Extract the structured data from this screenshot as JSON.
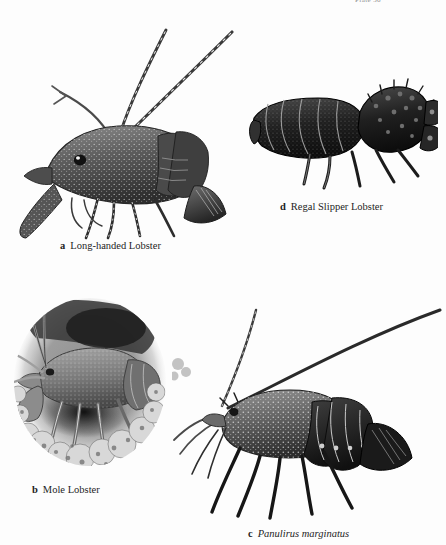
{
  "page": {
    "background_color": "#fdfdfd",
    "plate_header": "Plate 36",
    "medium": "grayscale scientific engraving / stipple illustration"
  },
  "figures": [
    {
      "key": "a",
      "letter": "a",
      "name": "Long-handed Lobster",
      "italic": false,
      "position": "upper-left",
      "description": "spiny lobster facing left with long banded antennae sweeping up and to the right"
    },
    {
      "key": "d",
      "letter": "d",
      "name": "Regal Slipper Lobster",
      "italic": false,
      "position": "upper-right",
      "description": "dark flattened slipper lobster facing right with broad plate-like antennae"
    },
    {
      "key": "b",
      "letter": "b",
      "name": "Mole Lobster",
      "italic": false,
      "position": "lower-left",
      "description": "burrowing lobster in an oval vignette surrounded by coral and algae"
    },
    {
      "key": "c",
      "letter": "c",
      "name": "Panulirus marginatus",
      "italic": true,
      "position": "lower-right",
      "description": "spiny lobster facing left with very long antennae arcing to upper right"
    }
  ],
  "icons": {
    "lobster": "lobster-illustration",
    "vignette": "oval-vignette"
  }
}
